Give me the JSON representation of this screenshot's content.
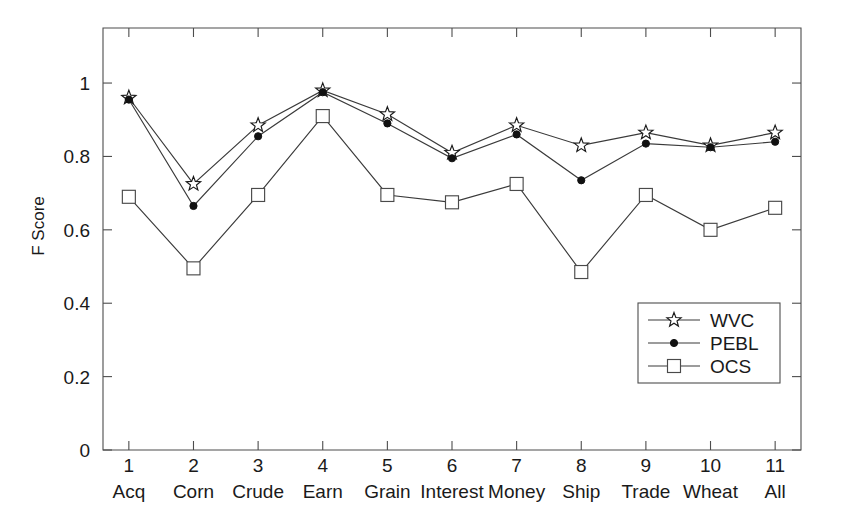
{
  "chart_data": {
    "type": "line",
    "title": "",
    "xlabel": "",
    "ylabel": "F Score",
    "ylim": [
      0,
      1.15
    ],
    "xlim": [
      0.6,
      11.4
    ],
    "grid": false,
    "legend_position": "lower-right",
    "x": [
      1,
      2,
      3,
      4,
      5,
      6,
      7,
      8,
      9,
      10,
      11
    ],
    "categories": [
      "Acq",
      "Corn",
      "Crude",
      "Earn",
      "Grain",
      "Interest",
      "Money",
      "Ship",
      "Trade",
      "Wheat",
      "All"
    ],
    "xtick_labels": [
      "1",
      "2",
      "3",
      "4",
      "5",
      "6",
      "7",
      "8",
      "9",
      "10",
      "11"
    ],
    "ytick_labels": [
      "0",
      "0.2",
      "0.4",
      "0.6",
      "0.8",
      "1"
    ],
    "ytick_values": [
      0,
      0.2,
      0.4,
      0.6,
      0.8,
      1
    ],
    "series": [
      {
        "name": "WVC",
        "marker": "star",
        "values": [
          0.96,
          0.725,
          0.885,
          0.98,
          0.915,
          0.81,
          0.885,
          0.83,
          0.865,
          0.83,
          0.865
        ]
      },
      {
        "name": "PEBL",
        "marker": "circle",
        "values": [
          0.955,
          0.665,
          0.855,
          0.975,
          0.89,
          0.795,
          0.86,
          0.735,
          0.835,
          0.825,
          0.84
        ]
      },
      {
        "name": "OCS",
        "marker": "square",
        "values": [
          0.69,
          0.495,
          0.695,
          0.91,
          0.695,
          0.675,
          0.725,
          0.485,
          0.695,
          0.6,
          0.66
        ]
      }
    ]
  },
  "legend": {
    "entries": [
      {
        "label": "WVC",
        "marker": "star-icon"
      },
      {
        "label": "PEBL",
        "marker": "filled-circle-icon"
      },
      {
        "label": "OCS",
        "marker": "open-square-icon"
      }
    ]
  },
  "axes": {
    "y_axis_title": "F Score"
  },
  "colors": {
    "line": "#3a3a3a",
    "axis": "#4d4d4d",
    "text": "#1a1a1a",
    "marker_fill": "#ffffff",
    "dot_fill": "#111111"
  }
}
